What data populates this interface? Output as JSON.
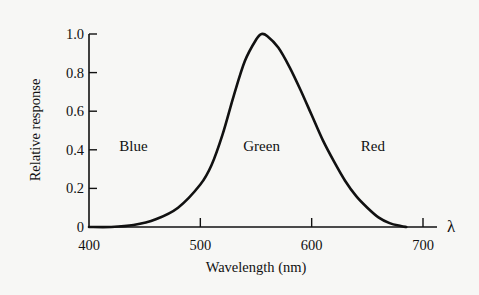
{
  "chart_data": {
    "type": "line",
    "title": "",
    "xlabel": "Wavelength (nm)",
    "ylabel": "Relative response",
    "x_axis_symbol": "λ",
    "xlim": [
      400,
      720
    ],
    "ylim": [
      0,
      1.0
    ],
    "x_ticks": [
      400,
      500,
      600,
      700
    ],
    "x_tick_labels": [
      "400",
      "500",
      "600",
      "700"
    ],
    "y_ticks": [
      0,
      0.2,
      0.4,
      0.6,
      0.8,
      1.0
    ],
    "y_tick_labels": [
      "0",
      "0.2",
      "0.4",
      "0.6",
      "0.8",
      "1.0"
    ],
    "grid": false,
    "annotations": [
      {
        "text": "Blue",
        "x": 440,
        "y": 0.46
      },
      {
        "text": "Green",
        "x": 555,
        "y": 0.46
      },
      {
        "text": "Red",
        "x": 655,
        "y": 0.46
      }
    ],
    "series": [
      {
        "name": "Luminous efficiency (relative response)",
        "x": [
          400,
          420,
          440,
          460,
          480,
          500,
          510,
          520,
          530,
          540,
          550,
          555,
          560,
          570,
          580,
          590,
          600,
          610,
          620,
          630,
          640,
          650,
          660,
          670,
          680,
          685
        ],
        "y": [
          0.0,
          0.0,
          0.01,
          0.04,
          0.1,
          0.22,
          0.32,
          0.48,
          0.68,
          0.86,
          0.97,
          1.0,
          0.99,
          0.93,
          0.83,
          0.71,
          0.58,
          0.45,
          0.34,
          0.24,
          0.16,
          0.1,
          0.05,
          0.02,
          0.005,
          0.0
        ]
      }
    ]
  }
}
